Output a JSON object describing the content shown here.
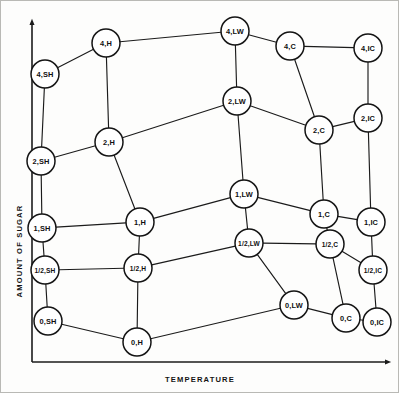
{
  "figure": {
    "axes": {
      "y_label": "AMOUNT OF SUGAR",
      "x_label": "TEMPERATURE"
    },
    "colors": {
      "ink": "#141414",
      "paper": "#fdfdfc",
      "frame": "#b9b9b5"
    }
  },
  "chart_data": {
    "type": "diagram",
    "title": "",
    "xlabel": "TEMPERATURE",
    "ylabel": "AMOUNT OF SUGAR",
    "nodes": [
      {
        "id": "4,SH",
        "label": "4,SH",
        "x": 45,
        "y": 74
      },
      {
        "id": "4,H",
        "label": "4,H",
        "x": 106,
        "y": 43
      },
      {
        "id": "4,LW",
        "label": "4,LW",
        "x": 235,
        "y": 31
      },
      {
        "id": "4,C",
        "label": "4,C",
        "x": 290,
        "y": 46
      },
      {
        "id": "4,IC",
        "label": "4,IC",
        "x": 368,
        "y": 48
      },
      {
        "id": "2,SH",
        "label": "2,SH",
        "x": 41,
        "y": 161
      },
      {
        "id": "2,H",
        "label": "2,H",
        "x": 109,
        "y": 142
      },
      {
        "id": "2,LW",
        "label": "2,LW",
        "x": 237,
        "y": 101
      },
      {
        "id": "2,C",
        "label": "2,C",
        "x": 319,
        "y": 130
      },
      {
        "id": "2,IC",
        "label": "2,IC",
        "x": 368,
        "y": 118
      },
      {
        "id": "1,SH",
        "label": "1,SH",
        "x": 42,
        "y": 228
      },
      {
        "id": "1,H",
        "label": "1,H",
        "x": 140,
        "y": 222
      },
      {
        "id": "1,LW",
        "label": "1,LW",
        "x": 244,
        "y": 194
      },
      {
        "id": "1,C",
        "label": "1,C",
        "x": 324,
        "y": 214
      },
      {
        "id": "1,IC",
        "label": "1,IC",
        "x": 371,
        "y": 222
      },
      {
        "id": "1/2,SH",
        "label": "1/2,SH",
        "x": 45,
        "y": 270
      },
      {
        "id": "1/2,H",
        "label": "1/2,H",
        "x": 138,
        "y": 268
      },
      {
        "id": "1/2,LW",
        "label": "1/2,LW",
        "x": 249,
        "y": 243
      },
      {
        "id": "1/2,C",
        "label": "1/2,C",
        "x": 330,
        "y": 244
      },
      {
        "id": "1/2,IC",
        "label": "1/2,IC",
        "x": 373,
        "y": 270
      },
      {
        "id": "0,SH",
        "label": "0,SH",
        "x": 48,
        "y": 321
      },
      {
        "id": "0,H",
        "label": "0,H",
        "x": 137,
        "y": 342
      },
      {
        "id": "0,LW",
        "label": "0,LW",
        "x": 294,
        "y": 305
      },
      {
        "id": "0,C",
        "label": "0,C",
        "x": 346,
        "y": 318
      },
      {
        "id": "0,IC",
        "label": "0,IC",
        "x": 377,
        "y": 322
      }
    ],
    "edges": [
      [
        "4,SH",
        "4,H"
      ],
      [
        "4,H",
        "4,LW"
      ],
      [
        "4,LW",
        "4,C"
      ],
      [
        "4,C",
        "4,IC"
      ],
      [
        "4,SH",
        "2,SH"
      ],
      [
        "4,H",
        "2,H"
      ],
      [
        "4,LW",
        "2,LW"
      ],
      [
        "4,C",
        "2,C"
      ],
      [
        "4,IC",
        "2,IC"
      ],
      [
        "2,SH",
        "2,H"
      ],
      [
        "2,H",
        "2,LW"
      ],
      [
        "2,LW",
        "2,C"
      ],
      [
        "2,C",
        "2,IC"
      ],
      [
        "2,SH",
        "1,SH"
      ],
      [
        "2,H",
        "1,H"
      ],
      [
        "2,LW",
        "1,LW"
      ],
      [
        "2,C",
        "1,C"
      ],
      [
        "2,IC",
        "1,IC"
      ],
      [
        "1,SH",
        "1,H"
      ],
      [
        "1,H",
        "1,LW"
      ],
      [
        "1,LW",
        "1,C"
      ],
      [
        "1,C",
        "1,IC"
      ],
      [
        "1,SH",
        "1/2,SH"
      ],
      [
        "1,H",
        "1/2,H"
      ],
      [
        "1,LW",
        "1/2,LW"
      ],
      [
        "1,C",
        "1/2,C"
      ],
      [
        "1,IC",
        "1/2,IC"
      ],
      [
        "1/2,SH",
        "1/2,H"
      ],
      [
        "1/2,H",
        "1/2,LW"
      ],
      [
        "1/2,LW",
        "1/2,C"
      ],
      [
        "1/2,C",
        "1/2,IC"
      ],
      [
        "1/2,SH",
        "0,SH"
      ],
      [
        "1/2,H",
        "0,H"
      ],
      [
        "1/2,LW",
        "0,LW"
      ],
      [
        "1/2,C",
        "0,C"
      ],
      [
        "1/2,IC",
        "0,IC"
      ],
      [
        "0,SH",
        "0,H"
      ],
      [
        "0,H",
        "0,LW"
      ],
      [
        "0,LW",
        "0,C"
      ],
      [
        "0,C",
        "0,IC"
      ]
    ],
    "node_radius": 14,
    "grid": false,
    "legend": "none"
  }
}
